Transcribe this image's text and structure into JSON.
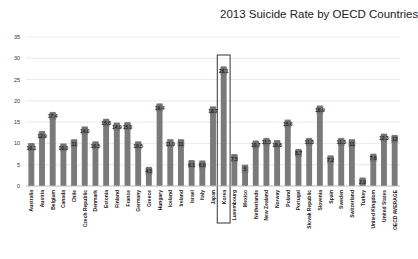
{
  "chart_data": {
    "type": "bar",
    "title": "2013 Suicide Rate by OECD Countries",
    "xlabel": "",
    "ylabel": "",
    "ylim": [
      0,
      35
    ],
    "yticks": [
      0,
      5,
      10,
      15,
      20,
      25,
      30,
      35
    ],
    "grid": true,
    "legend": "none",
    "highlighted_category": "Korea",
    "bar_color": "#7a7a7a",
    "categories": [
      "Australia",
      "Austria",
      "Belgium",
      "Canada",
      "Chile",
      "Czech Republic",
      "Denmark",
      "Estonia",
      "Finland",
      "France",
      "Germany",
      "Greece",
      "Hungary",
      "Iceland",
      "Ireland",
      "Israel",
      "Italy",
      "Japan",
      "Korea",
      "Luxembourg",
      "Mexico",
      "Netherlands",
      "New Zealand",
      "Norway",
      "Poland",
      "Portugal",
      "Slovak Republic",
      "Slovenia",
      "Spain",
      "Sweden",
      "Switzerland",
      "Turkey",
      "United Kingdom",
      "United States",
      "OECD AVERAGE"
    ],
    "values": [
      10.1,
      12.9,
      17.4,
      10.0,
      11,
      14.0,
      10.5,
      15.8,
      14.9,
      15.0,
      10.5,
      4.5,
      19.4,
      11.0,
      11,
      6.1,
      6.0,
      18.7,
      28.1,
      7.5,
      5,
      10.7,
      11.3,
      10.8,
      15.6,
      8.7,
      11.3,
      18.9,
      7.2,
      11.3,
      11,
      2.0,
      7.6,
      12.3,
      12
    ],
    "labels": [
      "10.1",
      "12.9",
      "17.4",
      "10.0",
      "11",
      "14.0",
      "10.5",
      "15.8",
      "14.9",
      "15.0",
      "10.5",
      "4.5",
      "19.4",
      "11.0",
      "11",
      "6.1",
      "6.0",
      "18.7",
      "28.1",
      "7.5",
      "5",
      "10.7",
      "11.3",
      "10.8",
      "15.6",
      "8.7",
      "11.3",
      "18.9",
      "7.2",
      "11.3",
      "11",
      "2.0",
      "7.6",
      "12.3",
      "12"
    ]
  }
}
